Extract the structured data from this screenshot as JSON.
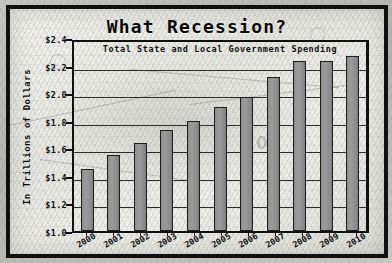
{
  "chart_data": {
    "type": "bar",
    "title": "What Recession?",
    "subtitle": "Total State and Local Government Spending",
    "xlabel": "",
    "ylabel": "In Trillions of Dollars",
    "categories": [
      "2000",
      "2001",
      "2002",
      "2003",
      "2004",
      "2005",
      "2006",
      "2007",
      "2008",
      "2009",
      "2010"
    ],
    "values": [
      1.45,
      1.55,
      1.64,
      1.73,
      1.8,
      1.9,
      1.97,
      2.12,
      2.23,
      2.23,
      2.27
    ],
    "ylim": [
      1.0,
      2.4
    ],
    "yticks": [
      1.0,
      1.2,
      1.4,
      1.6,
      1.8,
      2.0,
      2.2,
      2.4
    ],
    "ytick_labels": [
      "$1.0",
      "$1.2",
      "$1.4",
      "$1.6",
      "$1.8",
      "$2.0",
      "$2.2",
      "$2.4"
    ],
    "grid": true,
    "legend": "none",
    "bar_color": "#8e8e8e",
    "bar_edge_color": "#1d1d1d",
    "axis_color": "#101010",
    "background": "#e9e9e4",
    "frame_color": "#101010"
  },
  "background": {
    "watermark_text": "07"
  }
}
